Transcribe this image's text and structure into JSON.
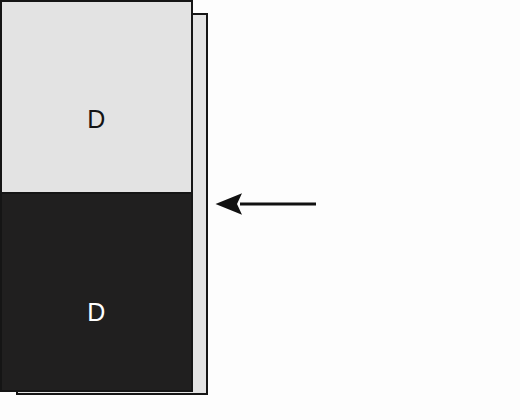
{
  "diagram": {
    "type": "flow-diagram",
    "background_color": "#fdfdfd",
    "nodes": [
      {
        "id": "node-e",
        "label": "E",
        "fill_color": "#e3e3e3",
        "text_color": "#141414",
        "border_color": "#151515",
        "shape": "rectangle",
        "position": "left"
      },
      {
        "id": "node-d-top",
        "label": "D",
        "fill_color": "#e3e3e3",
        "text_color": "#141414",
        "border_color": "#151515",
        "shape": "rectangle",
        "position": "right-top"
      },
      {
        "id": "node-d-bottom",
        "label": "D",
        "fill_color": "#201f1f",
        "text_color": "#ffffff",
        "border_color": "#151515",
        "shape": "rectangle",
        "position": "right-bottom"
      }
    ],
    "connectors": [
      {
        "id": "arrow-right-to-left",
        "from": "node-d-top",
        "to": "node-e",
        "direction": "left",
        "style": "solid",
        "color": "#111111",
        "head": "filled-triangle",
        "label": ""
      }
    ]
  }
}
